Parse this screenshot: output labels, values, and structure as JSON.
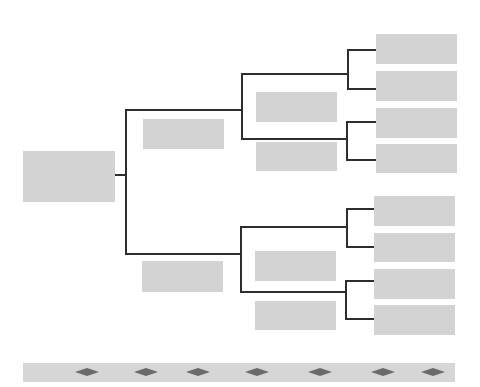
{
  "diagram": {
    "type": "bracket-tree",
    "colors": {
      "node_fill": "#d3d3d3",
      "connector": "#2e2e2e",
      "strip_fill": "#d6d6d6",
      "diamond_fill": "#6a6a6a"
    },
    "root": {
      "label": ""
    },
    "level1": [
      {
        "label": ""
      },
      {
        "label": ""
      }
    ],
    "level2": [
      {
        "label": ""
      },
      {
        "label": ""
      },
      {
        "label": ""
      },
      {
        "label": ""
      }
    ],
    "leaves": [
      {
        "label": ""
      },
      {
        "label": ""
      },
      {
        "label": ""
      },
      {
        "label": ""
      },
      {
        "label": ""
      },
      {
        "label": ""
      },
      {
        "label": ""
      },
      {
        "label": ""
      }
    ],
    "timeline_strip": {
      "markers": 7
    }
  }
}
